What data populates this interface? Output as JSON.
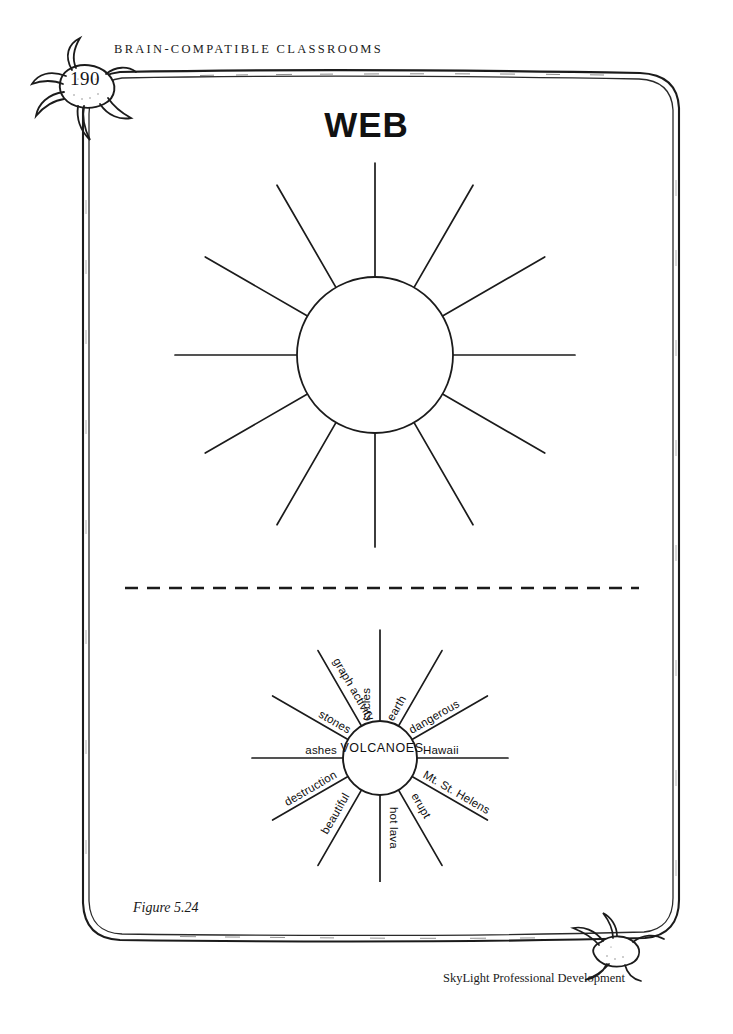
{
  "page": {
    "running_head": "BRAIN-COMPATIBLE CLASSROOMS",
    "page_number": "190",
    "worksheet_title": "WEB",
    "figure_caption": "Figure 5.24",
    "footer_credit": "SkyLight Professional Development",
    "ink_color": "#111111",
    "paper_color": "#ffffff"
  },
  "blank_web": {
    "center_label": "",
    "spoke_count": 12,
    "circle_radius": 78
  },
  "example_web": {
    "center_label": "VOLCANOES",
    "circle_radius": 37,
    "spokes": [
      {
        "label": "cycles",
        "angle": -90
      },
      {
        "label": "earth",
        "angle": -60
      },
      {
        "label": "dangerous",
        "angle": -30
      },
      {
        "label": "Hawaii",
        "angle": 0
      },
      {
        "label": "Mt. St. Helens",
        "angle": 30
      },
      {
        "label": "erupt",
        "angle": 60
      },
      {
        "label": "hot lava",
        "angle": 90
      },
      {
        "label": "beautiful",
        "angle": 120
      },
      {
        "label": "destruction",
        "angle": 150
      },
      {
        "label": "ashes",
        "angle": 180
      },
      {
        "label": "stones",
        "angle": 210
      },
      {
        "label": "graph activity",
        "angle": 240
      }
    ]
  }
}
